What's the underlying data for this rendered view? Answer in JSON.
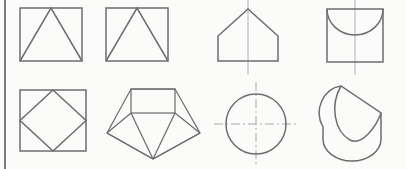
{
  "sheet": {
    "title": "Geometric figures exercise sheet",
    "background_color": "#fbfbfa",
    "line_color": "#6e6e70",
    "centerline_color": "#a9a9ac",
    "margin_rule_color": "#7b7b7e",
    "width": 406,
    "height": 169,
    "rows": 2,
    "columns": 4
  },
  "figures": [
    {
      "index": "1",
      "name": "square-with-inscribed-triangle",
      "label": "",
      "row": 1,
      "column": 1,
      "has_centerline": false,
      "description": "Square with an inscribed isosceles triangle whose apex meets the top edge midpoint and whose base is the bottom edge"
    },
    {
      "index": "2",
      "name": "square-with-inscribed-triangle",
      "label": "",
      "row": 1,
      "column": 2,
      "has_centerline": false,
      "description": "Square with an inscribed isosceles triangle whose apex meets the top edge midpoint and whose base is the bottom edge"
    },
    {
      "index": "3",
      "name": "pentagon-house-with-centerline",
      "label": "",
      "row": 1,
      "column": 3,
      "has_centerline": true,
      "description": "House-shaped pentagon: rectangle with a triangular roof, vertical centerline through the apex"
    },
    {
      "index": "4",
      "name": "square-with-semicircle-arc",
      "label": "",
      "row": 1,
      "column": 4,
      "has_centerline": true,
      "description": "Square with a downward semicircular arc spanning the top edge, vertical centerline"
    },
    {
      "index": "5",
      "name": "square-with-inscribed-diamond",
      "label": "",
      "row": 2,
      "column": 1,
      "has_centerline": false,
      "description": "Square with an inscribed diamond touching the midpoint of each side"
    },
    {
      "index": "6",
      "name": "pentagon-with-internal-edges",
      "label": "",
      "row": 2,
      "column": 2,
      "has_centerline": false,
      "description": "Pentagon outline containing a rectangle at the top and edges radiating from the bottom vertex to the rectangle corners and side vertices"
    },
    {
      "index": "7",
      "name": "circle-with-crossed-centerlines",
      "label": "",
      "row": 2,
      "column": 3,
      "has_centerline": true,
      "description": "Circle with dash-dot horizontal and vertical centerlines extending past the circumference"
    },
    {
      "index": "8",
      "name": "obliquely-cut-cylinder-solid",
      "label": "",
      "row": 2,
      "column": 4,
      "has_centerline": false,
      "description": "Three-dimensional solid: cylinder with rounded bottom truncated by an oblique plane forming an elliptical top face"
    }
  ]
}
